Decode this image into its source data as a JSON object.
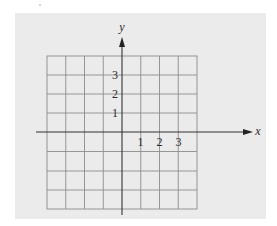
{
  "diagram": {
    "type": "coordinate-plane",
    "grid": {
      "columns": 8,
      "rows": 8,
      "x_range": [
        -4,
        4
      ],
      "y_range": [
        -4,
        4
      ],
      "line_color": "#8a8a8a"
    },
    "axes": {
      "x_label": "x",
      "y_label": "y",
      "axis_color": "#333333"
    },
    "x_ticks": [
      {
        "value": 1,
        "label": "1"
      },
      {
        "value": 2,
        "label": "2"
      },
      {
        "value": 3,
        "label": "3"
      }
    ],
    "y_ticks": [
      {
        "value": 3,
        "label": "3"
      },
      {
        "value": 2,
        "label": "2"
      },
      {
        "value": 1,
        "label": "1"
      }
    ],
    "background_color": "#ebebeb"
  }
}
